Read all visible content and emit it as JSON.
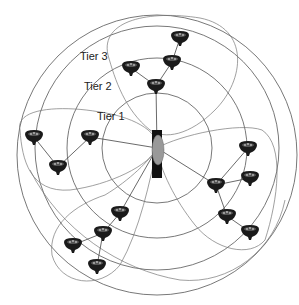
{
  "diagram": {
    "title": "",
    "labels": {
      "tier1": "Tier 1",
      "tier2": "Tier 2",
      "tier3": "Tier 3"
    },
    "center": {
      "x": 157,
      "y": 148,
      "type": "access-point"
    },
    "tiers": [
      {
        "name": "Tier 1",
        "radius": 55
      },
      {
        "name": "Tier 2",
        "radius": 90
      },
      {
        "name": "Tier 3",
        "radius": 122
      }
    ],
    "nodes": [
      {
        "id": "n1",
        "x": 180,
        "y": 38
      },
      {
        "id": "n2",
        "x": 172,
        "y": 62
      },
      {
        "id": "n3",
        "x": 156,
        "y": 86
      },
      {
        "id": "n4",
        "x": 131,
        "y": 68
      },
      {
        "id": "n5",
        "x": 34,
        "y": 137
      },
      {
        "id": "n6",
        "x": 90,
        "y": 137
      },
      {
        "id": "n7",
        "x": 58,
        "y": 167
      },
      {
        "id": "n8",
        "x": 248,
        "y": 148
      },
      {
        "id": "n9",
        "x": 250,
        "y": 178
      },
      {
        "id": "n10",
        "x": 216,
        "y": 185
      },
      {
        "id": "n11",
        "x": 227,
        "y": 216
      },
      {
        "id": "n12",
        "x": 250,
        "y": 232
      },
      {
        "id": "n13",
        "x": 120,
        "y": 213
      },
      {
        "id": "n14",
        "x": 103,
        "y": 233
      },
      {
        "id": "n15",
        "x": 73,
        "y": 245
      },
      {
        "id": "n16",
        "x": 97,
        "y": 266
      }
    ],
    "links": [
      [
        "center",
        "n3"
      ],
      [
        "n3",
        "n2"
      ],
      [
        "n2",
        "n1"
      ],
      [
        "n3",
        "n4"
      ],
      [
        "center",
        "n6"
      ],
      [
        "n6",
        "n7"
      ],
      [
        "n7",
        "n5"
      ],
      [
        "center",
        "n10"
      ],
      [
        "n10",
        "n8"
      ],
      [
        "n10",
        "n9"
      ],
      [
        "n10",
        "n11"
      ],
      [
        "n11",
        "n12"
      ],
      [
        "center",
        "n13"
      ],
      [
        "n13",
        "n14"
      ],
      [
        "n14",
        "n15"
      ],
      [
        "n14",
        "n16"
      ]
    ],
    "colors": {
      "ring": "#555555",
      "node": "#1a1a1a",
      "background": "#ffffff"
    }
  }
}
